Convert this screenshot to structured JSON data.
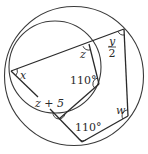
{
  "diagram": {
    "labels": {
      "x": "x",
      "z": "z",
      "y_num": "y",
      "y_den": "2",
      "angle_inner": "110°",
      "z_plus_5": "z + 5",
      "angle_bottom": "110°",
      "w": "w"
    },
    "colors": {
      "stroke": "#2a2a2a",
      "background": "#ffffff"
    }
  }
}
